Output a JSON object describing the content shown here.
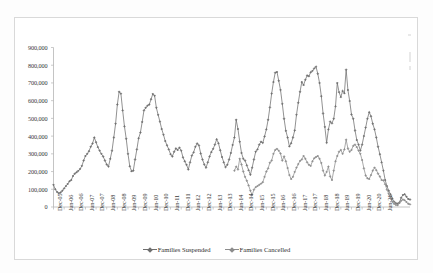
{
  "chart_data": {
    "type": "line",
    "title": "",
    "xlabel": "",
    "ylabel": "",
    "ylim": [
      0,
      900000
    ],
    "ytick_values": [
      0,
      100000,
      200000,
      300000,
      400000,
      500000,
      600000,
      700000,
      800000,
      900000
    ],
    "ytick_labels": [
      "0",
      "100,000",
      "200,000",
      "300,000",
      "400,000",
      "500,000",
      "600,000",
      "700,000",
      "800,000",
      "900,000"
    ],
    "grid": false,
    "legend_position": "bottom",
    "x_tick_labels": [
      "Dec-05",
      "Jun-06",
      "Dec-06",
      "Jun-07",
      "Dec-07",
      "Jun-08",
      "Dec-08",
      "Jun-09",
      "Dec-09",
      "Jun-10",
      "Dec-10",
      "Jun-11",
      "Dec-11",
      "Jun-12",
      "Dec-12",
      "Jun-13",
      "Dec-13",
      "Jun-14",
      "Dec-14",
      "Jun-15",
      "Dec-15",
      "Jun-16",
      "Dec-16",
      "Jun-17",
      "Dec-17",
      "Jun-18",
      "Dec-18",
      "Jun-19",
      "Dec-19",
      "Jun-20",
      "Dec-20",
      "Jun-21"
    ],
    "x_tick_index": [
      0,
      6,
      12,
      18,
      24,
      30,
      36,
      42,
      48,
      54,
      60,
      66,
      72,
      78,
      84,
      90,
      96,
      102,
      108,
      114,
      120,
      126,
      132,
      138,
      144,
      150,
      156,
      162,
      168,
      174,
      180,
      186
    ],
    "x_start_label": "Dec-05",
    "x_end_label": "Jun-21",
    "series": [
      {
        "name": "Families Suspended",
        "color": "#6e6e6e",
        "marker": "diamond",
        "start_index": 0,
        "values": [
          125000,
          100000,
          85000,
          78000,
          82000,
          92000,
          105000,
          118000,
          130000,
          145000,
          152000,
          175000,
          188000,
          196000,
          204000,
          215000,
          232000,
          262000,
          288000,
          300000,
          315000,
          340000,
          358000,
          392000,
          365000,
          338000,
          318000,
          300000,
          285000,
          262000,
          240000,
          228000,
          272000,
          318000,
          392000,
          470000,
          578000,
          650000,
          640000,
          545000,
          455000,
          385000,
          300000,
          230000,
          202000,
          205000,
          268000,
          325000,
          388000,
          420000,
          480000,
          545000,
          560000,
          572000,
          578000,
          608000,
          638000,
          628000,
          560000,
          520000,
          482000,
          440000,
          408000,
          372000,
          348000,
          325000,
          298000,
          285000,
          312000,
          330000,
          322000,
          335000,
          318000,
          280000,
          258000,
          238000,
          212000,
          252000,
          290000,
          308000,
          340000,
          358000,
          348000,
          302000,
          268000,
          240000,
          222000,
          252000,
          285000,
          310000,
          328000,
          352000,
          382000,
          360000,
          320000,
          282000,
          252000,
          225000,
          238000,
          268000,
          305000,
          350000,
          392000,
          492000,
          440000,
          368000,
          305000,
          272000,
          262000,
          235000,
          208000,
          182000,
          222000,
          268000,
          312000,
          325000,
          352000,
          368000,
          362000,
          398000,
          438000,
          492000,
          562000,
          640000,
          705000,
          758000,
          762000,
          712000,
          660000,
          582000,
          498000,
          430000,
          392000,
          342000,
          360000,
          392000,
          432000,
          520000,
          588000,
          650000,
          705000,
          688000,
          718000,
          742000,
          738000,
          760000,
          768000,
          782000,
          792000,
          752000,
          700000,
          625000,
          528000,
          452000,
          362000,
          438000,
          482000,
          472000,
          498000,
          568000,
          700000,
          648000,
          620000,
          655000,
          642000,
          775000,
          660000,
          598000,
          522000,
          498000,
          432000,
          378000,
          352000,
          318000,
          352000,
          400000,
          448000,
          498000,
          535000,
          512000,
          470000,
          438000,
          392000,
          340000,
          298000,
          252000,
          205000,
          152000,
          118000,
          92000,
          72000,
          48000,
          30000,
          22000,
          18000,
          25000,
          52000,
          68000,
          72000,
          58000,
          45000,
          42000
        ]
      },
      {
        "name": "Families Cancelled",
        "color": "#8c8c8c",
        "marker": "diamond",
        "start_index": 102,
        "values": [
          205000,
          228000,
          212000,
          272000,
          240000,
          200000,
          170000,
          148000,
          122000,
          92000,
          68000,
          98000,
          112000,
          118000,
          125000,
          132000,
          140000,
          170000,
          200000,
          218000,
          250000,
          262000,
          300000,
          322000,
          328000,
          318000,
          302000,
          262000,
          285000,
          258000,
          220000,
          180000,
          158000,
          170000,
          198000,
          222000,
          242000,
          260000,
          268000,
          288000,
          272000,
          252000,
          238000,
          232000,
          258000,
          275000,
          282000,
          288000,
          272000,
          248000,
          205000,
          178000,
          198000,
          228000,
          172000,
          152000,
          205000,
          258000,
          288000,
          312000,
          322000,
          300000,
          325000,
          380000,
          330000,
          312000,
          322000,
          345000,
          352000,
          338000,
          318000,
          300000,
          265000,
          218000,
          178000,
          162000,
          158000,
          180000,
          205000,
          222000,
          208000,
          188000,
          172000,
          152000,
          150000,
          128000,
          98000,
          75000,
          52000,
          30000,
          18000,
          12000,
          10000,
          22000,
          35000,
          42000,
          38000,
          28000,
          18000,
          15000
        ]
      }
    ]
  },
  "legend": {
    "items": [
      {
        "label": "Families Suspended",
        "color": "#6e6e6e"
      },
      {
        "label": "Families Cancelled",
        "color": "#8c8c8c"
      }
    ]
  },
  "axes": {
    "y_axis_name": "value-axis",
    "x_axis_name": "category-axis"
  }
}
